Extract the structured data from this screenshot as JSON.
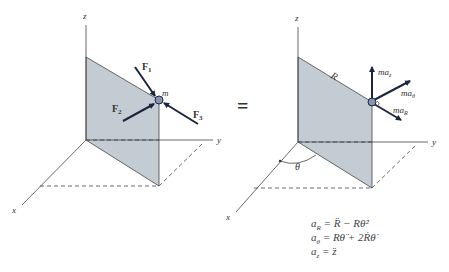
{
  "left_figure": {
    "axes": {
      "x": "x",
      "y": "y",
      "z": "z"
    },
    "mass_label": "m",
    "forces": [
      {
        "label": "F",
        "sub": "1"
      },
      {
        "label": "F",
        "sub": "2"
      },
      {
        "label": "F",
        "sub": "3"
      }
    ]
  },
  "equals_sign": "=",
  "right_figure": {
    "axes": {
      "x": "x",
      "y": "y",
      "z": "z"
    },
    "radius_label": "R",
    "angle_label": "θ",
    "inertial_vectors": [
      {
        "label": "ma",
        "sub": "z"
      },
      {
        "label": "ma",
        "sub": "θ"
      },
      {
        "label": "ma",
        "sub": "R"
      }
    ]
  },
  "equations": [
    {
      "lhs": "a",
      "lhs_sub": "R",
      "rhs": "= R̈ − Rθ̇²"
    },
    {
      "lhs": "a",
      "lhs_sub": "θ",
      "rhs": "= Rθ̈ + 2Ṙθ̇"
    },
    {
      "lhs": "a",
      "lhs_sub": "z",
      "rhs": "= z̈"
    }
  ],
  "colors": {
    "plane_fill": "#c3ccd3",
    "line": "#333333",
    "vector": "#1a2540",
    "particle": "#8a95ad"
  }
}
